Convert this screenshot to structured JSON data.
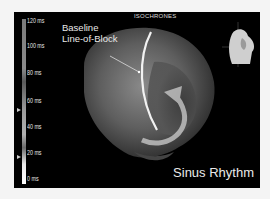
{
  "panel": {
    "title": "ISOCHRONES",
    "annotation_line1": "Baseline",
    "annotation_line2": "Line-of-Block",
    "rhythm_label": "Sinus Rhythm"
  },
  "color_scale": {
    "unit": "ms",
    "ticks": [
      "120 ms",
      "100 ms",
      "80 ms",
      "60 ms",
      "40 ms",
      "20 ms",
      "0 ms"
    ]
  },
  "icons": {
    "orientation": "torso-orientation-icon",
    "rotation_arrow": "curved-arrow-icon",
    "line_of_block": "line-of-block-curve"
  },
  "colors": {
    "background": "#000000",
    "frame": "#f4f4f4",
    "text": "#e8e8e8"
  }
}
